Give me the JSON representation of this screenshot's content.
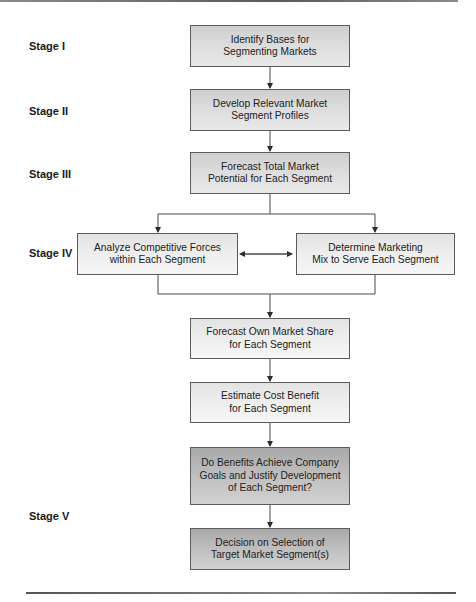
{
  "diagram": {
    "type": "flowchart",
    "stages": [
      {
        "id": "I",
        "label": "Stage I"
      },
      {
        "id": "II",
        "label": "Stage II"
      },
      {
        "id": "III",
        "label": "Stage III"
      },
      {
        "id": "IV",
        "label": "Stage IV"
      },
      {
        "id": "V",
        "label": "Stage V"
      }
    ],
    "nodes": {
      "identify_bases": {
        "line1": "Identify Bases for",
        "line2": "Segmenting Markets"
      },
      "develop_profiles": {
        "line1": "Develop Relevant Market",
        "line2": "Segment Profiles"
      },
      "forecast_total": {
        "line1": "Forecast Total Market",
        "line2": "Potential for Each Segment"
      },
      "analyze_forces": {
        "line1": "Analyze Competitive Forces",
        "line2": "within Each Segment"
      },
      "determine_mix": {
        "line1": "Determine Marketing",
        "line2": "Mix to Serve Each Segment"
      },
      "forecast_share": {
        "line1": "Forecast Own Market Share",
        "line2": "for Each Segment"
      },
      "estimate_cost": {
        "line1": "Estimate Cost Benefit",
        "line2": "for Each Segment"
      },
      "benefits_check": {
        "line1": "Do Benefits Achieve Company",
        "line2": "Goals and Justify Development",
        "line3": "of Each Segment?"
      },
      "decision": {
        "line1": "Decision on Selection of",
        "line2": "Target Market Segment(s)"
      }
    },
    "edges": [
      {
        "from": "identify_bases",
        "to": "develop_profiles"
      },
      {
        "from": "develop_profiles",
        "to": "forecast_total"
      },
      {
        "from": "forecast_total",
        "to": "analyze_forces"
      },
      {
        "from": "forecast_total",
        "to": "determine_mix"
      },
      {
        "from": "analyze_forces",
        "to": "determine_mix",
        "bidirectional": true
      },
      {
        "from": "analyze_forces",
        "to": "forecast_share"
      },
      {
        "from": "determine_mix",
        "to": "forecast_share"
      },
      {
        "from": "forecast_share",
        "to": "estimate_cost"
      },
      {
        "from": "estimate_cost",
        "to": "benefits_check"
      },
      {
        "from": "benefits_check",
        "to": "decision"
      }
    ],
    "colors": {
      "box_border": "#5c5c5c",
      "box_fill_dark": "#d6d6d6",
      "box_fill_light": "#ededed",
      "box_fill_darker": "#bdbdbd",
      "line": "#4a4a4a"
    }
  }
}
